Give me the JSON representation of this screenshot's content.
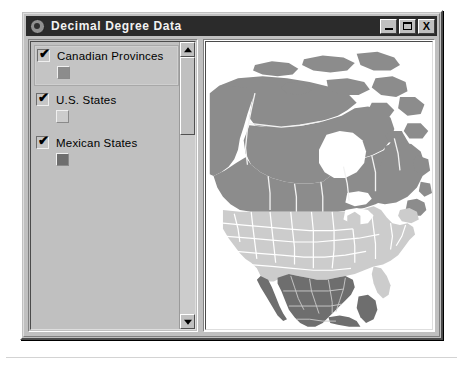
{
  "window": {
    "title": "Decimal Degree Data",
    "icon": "globe-icon",
    "controls": {
      "minimize_label": "_",
      "maximize_label": "□",
      "close_label": "X"
    }
  },
  "legend": {
    "items": [
      {
        "label": "Canadian Provinces",
        "checked": true,
        "check_glyph": "✔",
        "swatch_color": "#8c8c8c",
        "selected": true
      },
      {
        "label": "U.S. States",
        "checked": true,
        "check_glyph": "✔",
        "swatch_color": "#cccccc",
        "selected": false
      },
      {
        "label": "Mexican States",
        "checked": true,
        "check_glyph": "✔",
        "swatch_color": "#6e6e6e",
        "selected": false
      }
    ],
    "scrollbar": {
      "up_arrow": "scroll-up-arrow",
      "down_arrow": "scroll-down-arrow"
    }
  },
  "map": {
    "name": "north-america-map",
    "background": "#ffffff",
    "border_color": "#ffffff",
    "layers": [
      {
        "name": "Canadian Provinces",
        "fill": "#8c8c8c"
      },
      {
        "name": "U.S. States",
        "fill": "#cccccc"
      },
      {
        "name": "Mexican States",
        "fill": "#6e6e6e"
      }
    ]
  }
}
